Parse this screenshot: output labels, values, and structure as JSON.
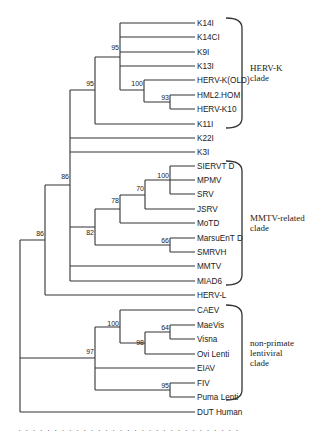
{
  "figure": {
    "type": "phylogenetic-tree",
    "tips": [
      {
        "label": "K14I",
        "y": 23
      },
      {
        "label": "K14CI",
        "y": 37
      },
      {
        "label": "K9I",
        "y": 52
      },
      {
        "label": "K13I",
        "y": 66
      },
      {
        "label": "HERV-K(OLD)",
        "y": 80
      },
      {
        "label": "HML2.HOM",
        "y": 95
      },
      {
        "label": "HERV-K10",
        "y": 109
      },
      {
        "label": "K11I",
        "y": 124
      },
      {
        "label": "K22I",
        "y": 138
      },
      {
        "label": "K3I",
        "y": 152
      },
      {
        "label": "SIERVT D",
        "y": 166
      },
      {
        "label": "MPMV",
        "y": 180
      },
      {
        "label": "SRV",
        "y": 194
      },
      {
        "label": "JSRV",
        "y": 209
      },
      {
        "label": "MoTD",
        "y": 223
      },
      {
        "label": "MarsuEnT D",
        "y": 238
      },
      {
        "label": "SMRVH",
        "y": 252
      },
      {
        "label": "MMTV",
        "y": 266
      },
      {
        "label": "MIAD6",
        "y": 281
      },
      {
        "label": "HERV-L",
        "y": 295
      },
      {
        "label": "CAEV",
        "y": 310
      },
      {
        "label": "MaeVis",
        "y": 325
      },
      {
        "label": "Visna",
        "y": 339
      },
      {
        "label": "Ovi Lenti",
        "y": 354
      },
      {
        "label": "EIAV",
        "y": 368
      },
      {
        "label": "FIV",
        "y": 383
      },
      {
        "label": "Puma Lenti",
        "y": 397
      },
      {
        "label": "DUT Human",
        "y": 412
      }
    ],
    "bootstrap": [
      {
        "value": "95",
        "x": 120,
        "y": 52
      },
      {
        "value": "100",
        "x": 144,
        "y": 88
      },
      {
        "value": "93",
        "x": 170,
        "y": 102
      },
      {
        "value": "95",
        "x": 95,
        "y": 88
      },
      {
        "value": "86",
        "x": 70,
        "y": 181
      },
      {
        "value": "82",
        "x": 95,
        "y": 237
      },
      {
        "value": "78",
        "x": 120,
        "y": 205
      },
      {
        "value": "70",
        "x": 145,
        "y": 193
      },
      {
        "value": "100",
        "x": 170,
        "y": 180
      },
      {
        "value": "66",
        "x": 170,
        "y": 245
      },
      {
        "value": "86",
        "x": 45,
        "y": 238
      },
      {
        "value": "97",
        "x": 95,
        "y": 356
      },
      {
        "value": "100",
        "x": 120,
        "y": 328
      },
      {
        "value": "98",
        "x": 145,
        "y": 347
      },
      {
        "value": "64",
        "x": 170,
        "y": 332
      },
      {
        "value": "95",
        "x": 170,
        "y": 390
      }
    ],
    "clades": [
      {
        "line1": "HERV-K",
        "line2": "clade",
        "top": 18,
        "bottom": 128
      },
      {
        "line1": "MMTV-related",
        "line2": "clade",
        "top": 161,
        "bottom": 285
      },
      {
        "line1": "non-primate",
        "line2": "lentiviral",
        "line3": "clade",
        "top": 305,
        "bottom": 400
      }
    ],
    "caption_partial": "· · · · · · · · · · · · · · · · · · · · · · · · · · · · · · ·"
  }
}
